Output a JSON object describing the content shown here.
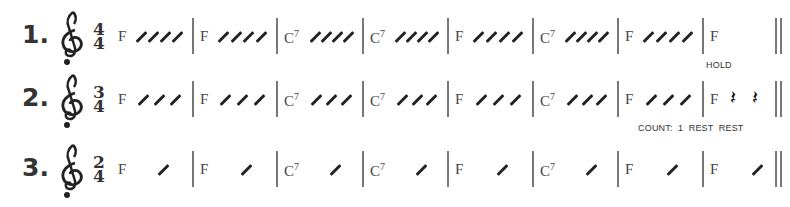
{
  "exercises": [
    {
      "number": "1.",
      "time_signature": {
        "top": "4",
        "bottom": "4"
      },
      "clef": "treble-clef",
      "measures": [
        {
          "chord": "F",
          "sup": "",
          "slashes": 4
        },
        {
          "chord": "F",
          "sup": "",
          "slashes": 4
        },
        {
          "chord": "C",
          "sup": "7",
          "slashes": 4
        },
        {
          "chord": "C",
          "sup": "7",
          "slashes": 4
        },
        {
          "chord": "F",
          "sup": "",
          "slashes": 4
        },
        {
          "chord": "C",
          "sup": "7",
          "slashes": 4
        },
        {
          "chord": "F",
          "sup": "",
          "slashes": 4
        },
        {
          "chord": "F",
          "sup": "",
          "slashes": 0
        }
      ],
      "annotation": "HOLD"
    },
    {
      "number": "2.",
      "time_signature": {
        "top": "3",
        "bottom": "4"
      },
      "clef": "treble-clef",
      "measures": [
        {
          "chord": "F",
          "sup": "",
          "slashes": 3
        },
        {
          "chord": "F",
          "sup": "",
          "slashes": 3
        },
        {
          "chord": "C",
          "sup": "7",
          "slashes": 3
        },
        {
          "chord": "C",
          "sup": "7",
          "slashes": 3
        },
        {
          "chord": "F",
          "sup": "",
          "slashes": 3
        },
        {
          "chord": "C",
          "sup": "7",
          "slashes": 3
        },
        {
          "chord": "F",
          "sup": "",
          "slashes": 3
        },
        {
          "chord": "F",
          "sup": "",
          "slashes": 0,
          "rests": 2
        }
      ],
      "annotation": "COUNT:  1  REST  REST"
    },
    {
      "number": "3.",
      "time_signature": {
        "top": "2",
        "bottom": "4"
      },
      "clef": "treble-clef",
      "measures": [
        {
          "chord": "F",
          "sup": "",
          "slashes": 1
        },
        {
          "chord": "F",
          "sup": "",
          "slashes": 1
        },
        {
          "chord": "C",
          "sup": "7",
          "slashes": 1
        },
        {
          "chord": "C",
          "sup": "7",
          "slashes": 1
        },
        {
          "chord": "F",
          "sup": "",
          "slashes": 1
        },
        {
          "chord": "C",
          "sup": "7",
          "slashes": 1
        },
        {
          "chord": "F",
          "sup": "",
          "slashes": 1
        },
        {
          "chord": "F",
          "sup": "",
          "slashes": 1
        }
      ],
      "annotation": ""
    }
  ],
  "glyphs": {
    "rest": "𝄽"
  }
}
